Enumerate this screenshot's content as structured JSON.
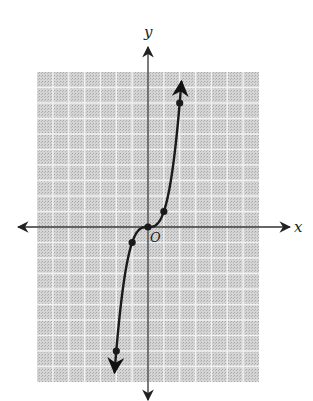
{
  "chart_data": {
    "type": "line",
    "title": "",
    "function": "y = x^3",
    "xlabel": "x",
    "ylabel": "y",
    "origin_label": "O",
    "xlim": [
      -7,
      7
    ],
    "ylim": [
      -10,
      10
    ],
    "grid": true,
    "grid_step": 1,
    "legend": null,
    "series": [
      {
        "name": "y = x^3",
        "points": [
          {
            "x": -2,
            "y": -8
          },
          {
            "x": -1,
            "y": -1
          },
          {
            "x": 0,
            "y": 0
          },
          {
            "x": 1,
            "y": 1
          },
          {
            "x": 2,
            "y": 8
          }
        ],
        "arrows_at_ends": true
      }
    ]
  },
  "colors": {
    "grid_background": "#c9c9c9",
    "grid_line": "#f2f2f2",
    "axis": "#333333",
    "curve": "#1a1a1a"
  }
}
